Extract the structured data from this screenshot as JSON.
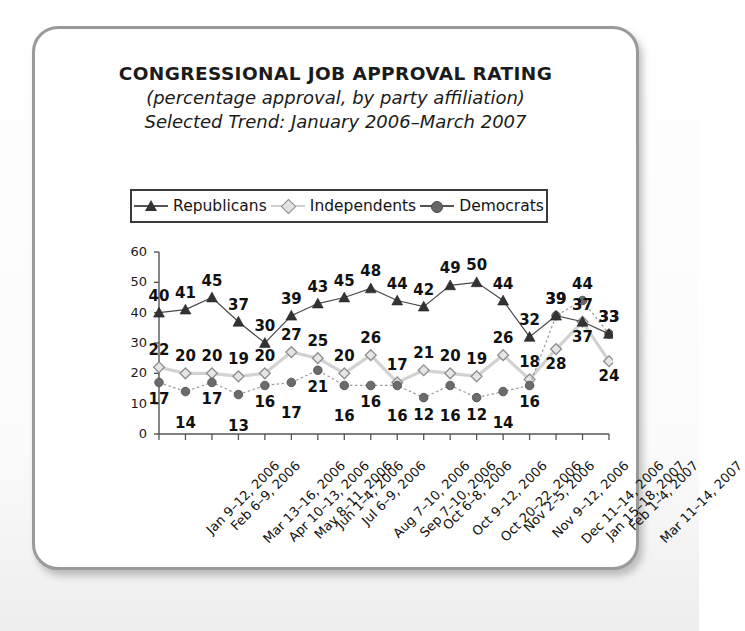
{
  "card": {
    "title_line1": "CONGRESSIONAL JOB APPROVAL RATING",
    "title_line2": "(percentage approval, by party affiliation)",
    "title_line3": "Selected Trend: January 2006–March 2007"
  },
  "legend": {
    "position": "top-inside",
    "items": [
      {
        "label": "Republicans",
        "marker": "triangle-marker",
        "color": "#333333"
      },
      {
        "label": "Independents",
        "marker": "diamond-marker",
        "color": "#c9c9c9"
      },
      {
        "label": "Democrats",
        "marker": "circle-marker",
        "color": "#666666"
      }
    ]
  },
  "chart_data": {
    "type": "line",
    "title": "CONGRESSIONAL JOB APPROVAL RATING",
    "subtitle": "(percentage approval, by party affiliation)",
    "subtitle2": "Selected Trend: January 2006–March 2007",
    "xlabel": "",
    "ylabel": "",
    "ylim": [
      0,
      60
    ],
    "yticks": [
      0,
      10,
      20,
      30,
      40,
      50,
      60
    ],
    "grid": false,
    "legend_position": "top",
    "categories": [
      "Jan 9–12, 2006",
      "Feb 6–9, 2006",
      "Mar 13–16, 2006",
      "Apr 10–13, 2006",
      "May 8–11, 2006",
      "Jun 1–4, 2006",
      "Jul 6–9, 2006",
      "Aug 7–10, 2006",
      "Sep 7–10, 2006",
      "Oct 6–8, 2006",
      "Oct 9–12, 2006",
      "Oct 20–22, 2006",
      "Nov 2–5, 2006",
      "Nov 9–12, 2006",
      "Dec 11–14, 2006",
      "Jan 15–18, 2007",
      "Feb 1–4, 2007",
      "Mar 11–14, 2007"
    ],
    "series": [
      {
        "name": "Republicans",
        "marker": "triangle-marker",
        "color": "#333333",
        "values": [
          40,
          41,
          45,
          37,
          30,
          39,
          43,
          45,
          48,
          44,
          42,
          49,
          50,
          44,
          32,
          39,
          37,
          33
        ]
      },
      {
        "name": "Independents",
        "marker": "diamond-marker",
        "color": "#c9c9c9",
        "values": [
          22,
          20,
          20,
          19,
          20,
          27,
          25,
          20,
          26,
          17,
          21,
          20,
          19,
          26,
          18,
          28,
          37,
          24
        ]
      },
      {
        "name": "Democrats",
        "marker": "circle-marker",
        "color": "#666666",
        "values": [
          17,
          14,
          17,
          13,
          16,
          17,
          21,
          16,
          16,
          16,
          12,
          16,
          12,
          14,
          16,
          39,
          44,
          33
        ]
      }
    ]
  }
}
